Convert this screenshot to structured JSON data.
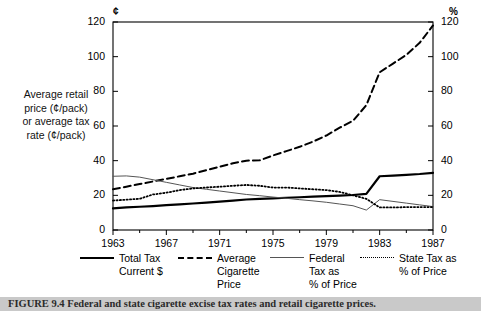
{
  "figure": {
    "caption_label": "FIGURE 9.4",
    "caption_text": "Federal and state cigarette excise tax rates and retail cigarette prices.",
    "y_axis_label": "Average retail price (¢/pack) or average tax rate (¢/pack)",
    "left_unit": "¢",
    "right_unit": "%"
  },
  "legend": {
    "items": [
      {
        "label_lines": [
          "Total Tax",
          "Current $"
        ],
        "style": "solid",
        "color": "#000000"
      },
      {
        "label_lines": [
          "Average",
          "Cigarette",
          "Price"
        ],
        "style": "dashed",
        "color": "#000000"
      },
      {
        "label_lines": [
          "Federal",
          "Tax as",
          "% of Price"
        ],
        "style": "thin",
        "color": "#555555"
      },
      {
        "label_lines": [
          "State Tax as",
          "% of Price"
        ],
        "style": "dotted",
        "color": "#000000"
      }
    ]
  },
  "chart_data": {
    "type": "line",
    "title": "Federal and state cigarette excise tax rates and retail cigarette prices",
    "xlabel": "",
    "ylabel": "Average retail price (¢/pack) or average tax rate (¢/pack)",
    "y2label": "%",
    "xlim": [
      1963,
      1987
    ],
    "ylim": [
      0,
      120
    ],
    "y2lim": [
      0,
      120
    ],
    "yticks": [
      0,
      20,
      40,
      60,
      80,
      100,
      120
    ],
    "y2ticks": [
      0,
      20,
      40,
      60,
      80,
      100,
      120
    ],
    "xticks": [
      1963,
      1967,
      1971,
      1975,
      1979,
      1983,
      1987
    ],
    "xminorticks": [
      1965,
      1969,
      1973,
      1977,
      1981,
      1985
    ],
    "grid": false,
    "legend_position": "below",
    "x": [
      1963,
      1964,
      1965,
      1966,
      1967,
      1968,
      1969,
      1970,
      1971,
      1972,
      1973,
      1974,
      1975,
      1976,
      1977,
      1978,
      1979,
      1980,
      1981,
      1982,
      1983,
      1984,
      1985,
      1986,
      1987
    ],
    "series": [
      {
        "name": "Total Tax Current $",
        "style": "solid",
        "axis": "left",
        "units": "¢/pack",
        "values": [
          12.5,
          13.0,
          13.4,
          13.8,
          14.3,
          14.8,
          15.3,
          15.8,
          16.4,
          17.0,
          17.6,
          18.0,
          18.3,
          18.6,
          18.9,
          19.2,
          19.5,
          19.8,
          20.2,
          20.8,
          31.0,
          31.4,
          31.8,
          32.3,
          33.0
        ]
      },
      {
        "name": "Average Cigarette Price",
        "style": "dashed",
        "axis": "left",
        "units": "¢/pack",
        "values": [
          23.5,
          25.0,
          26.5,
          28.0,
          29.5,
          31.0,
          32.5,
          34.5,
          36.5,
          38.5,
          40.0,
          40.2,
          43.0,
          45.5,
          48.0,
          51.0,
          54.5,
          59.0,
          63.0,
          72.0,
          91.0,
          96.0,
          101.0,
          108.0,
          118.0
        ]
      },
      {
        "name": "Federal Tax as % of Price",
        "style": "thin",
        "axis": "right",
        "units": "%",
        "values": [
          31.0,
          31.2,
          30.5,
          29.0,
          27.5,
          26.0,
          24.5,
          23.5,
          22.5,
          21.5,
          20.5,
          19.8,
          19.0,
          18.3,
          17.5,
          16.8,
          16.0,
          15.0,
          14.0,
          11.5,
          17.5,
          16.5,
          15.5,
          14.5,
          13.5
        ]
      },
      {
        "name": "State Tax as % of Price",
        "style": "dotted",
        "axis": "right",
        "units": "%",
        "values": [
          17.0,
          17.5,
          18.0,
          20.5,
          21.5,
          23.0,
          24.0,
          24.5,
          25.0,
          25.5,
          26.0,
          25.5,
          24.5,
          24.5,
          24.0,
          23.5,
          23.0,
          22.0,
          20.0,
          18.0,
          13.0,
          13.0,
          13.2,
          13.2,
          13.2
        ]
      }
    ]
  }
}
